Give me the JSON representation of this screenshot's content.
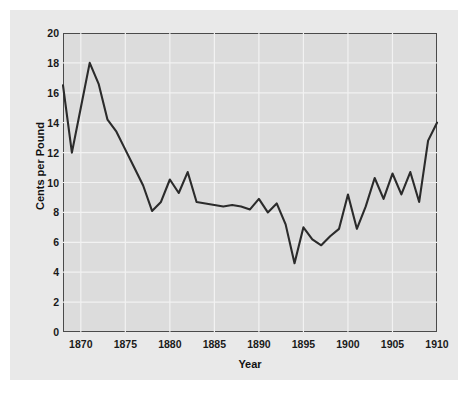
{
  "figure": {
    "background_color": "#e9e9e9",
    "plot_background_color": "#dcdcdc",
    "axis_color": "#4a4a4a",
    "grid_color": "#f2f2f2",
    "line_color": "#2b2b2b"
  },
  "axes": {
    "y_title": "Cents per Pound",
    "x_title": "Year",
    "y_ticks": [
      "0",
      "2",
      "4",
      "6",
      "8",
      "10",
      "12",
      "14",
      "16",
      "18",
      "20"
    ],
    "x_ticks": [
      "1870",
      "1875",
      "1880",
      "1885",
      "1890",
      "1895",
      "1900",
      "1905",
      "1910"
    ]
  },
  "chart_data": {
    "type": "line",
    "title": "",
    "xlabel": "Year",
    "ylabel": "Cents per Pound",
    "xlim": [
      1868,
      1910
    ],
    "ylim": [
      0,
      20
    ],
    "xticks": [
      1870,
      1875,
      1880,
      1885,
      1890,
      1895,
      1900,
      1905,
      1910
    ],
    "yticks": [
      0,
      2,
      4,
      6,
      8,
      10,
      12,
      14,
      16,
      18,
      20
    ],
    "grid": true,
    "legend": false,
    "x": [
      1868,
      1869,
      1870,
      1871,
      1872,
      1873,
      1874,
      1875,
      1876,
      1877,
      1878,
      1879,
      1880,
      1881,
      1882,
      1883,
      1884,
      1885,
      1886,
      1887,
      1888,
      1889,
      1890,
      1891,
      1892,
      1893,
      1894,
      1895,
      1896,
      1897,
      1898,
      1899,
      1900,
      1901,
      1902,
      1903,
      1904,
      1905,
      1906,
      1907,
      1908,
      1909,
      1910
    ],
    "values": [
      16.5,
      12.0,
      15.0,
      18.0,
      16.6,
      14.2,
      13.4,
      12.2,
      11.0,
      9.8,
      8.1,
      8.7,
      10.2,
      9.3,
      10.7,
      8.7,
      8.6,
      8.5,
      8.4,
      8.5,
      8.4,
      8.2,
      8.9,
      8.0,
      8.6,
      7.2,
      4.6,
      7.0,
      6.2,
      5.8,
      6.4,
      6.9,
      9.2,
      6.9,
      8.4,
      10.3,
      8.9,
      10.6,
      9.2,
      10.7,
      8.7,
      12.8,
      14.0
    ],
    "series": [
      {
        "name": "price",
        "values": [
          16.5,
          12.0,
          15.0,
          18.0,
          16.6,
          14.2,
          13.4,
          12.2,
          11.0,
          9.8,
          8.1,
          8.7,
          10.2,
          9.3,
          10.7,
          8.7,
          8.6,
          8.5,
          8.4,
          8.5,
          8.4,
          8.2,
          8.9,
          8.0,
          8.6,
          7.2,
          4.6,
          7.0,
          6.2,
          5.8,
          6.4,
          6.9,
          9.2,
          6.9,
          8.4,
          10.3,
          8.9,
          10.6,
          9.2,
          10.7,
          8.7,
          12.8,
          14.0
        ]
      }
    ]
  }
}
